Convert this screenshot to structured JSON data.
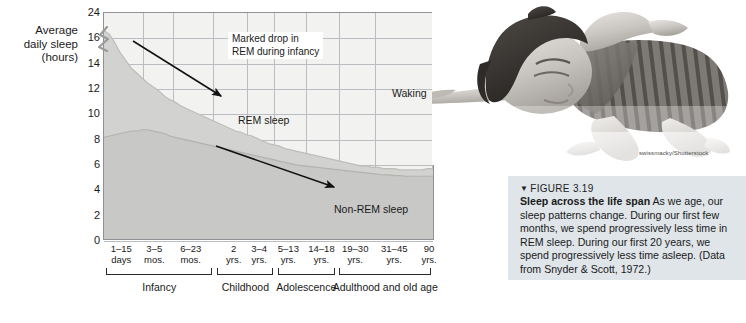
{
  "figure": {
    "number": "FIGURE 3.19",
    "marker_glyph": "▼",
    "title": "Sleep across the life span",
    "body": "As we age, our sleep patterns change. During our first few months, we spend progressively less time in REM sleep. During our first 20 years, we spend progressively less time asleep. (Data from Snyder & Scott, 1972.)",
    "photo_credit": "swissmacky/Shutterstock",
    "photo_alt": "sleeping-child-photo"
  },
  "chart_data": {
    "type": "area",
    "title": "",
    "ylabel": "Average daily sleep (hours)",
    "ylabel_lines": [
      "Average",
      "daily sleep",
      "(hours)"
    ],
    "xlabel": "",
    "ylim": [
      0,
      18
    ],
    "y_ticks": [
      0,
      2,
      4,
      6,
      8,
      10,
      12,
      14,
      16,
      24
    ],
    "y_axis_break": true,
    "y_axis_break_between": [
      16,
      24
    ],
    "grid": true,
    "legend_position": "in-plot-annotations",
    "x_tick_labels": [
      {
        "line1": "1–15",
        "line2": "days",
        "pos": 0.055
      },
      {
        "line1": "3–5",
        "line2": "mos.",
        "pos": 0.155
      },
      {
        "line1": "6–23",
        "line2": "mos.",
        "pos": 0.265
      },
      {
        "line1": "2",
        "line2": "yrs.",
        "pos": 0.395
      },
      {
        "line1": "3–4",
        "line2": "yrs.",
        "pos": 0.472
      },
      {
        "line1": "5–13",
        "line2": "yrs.",
        "pos": 0.56
      },
      {
        "line1": "14–18",
        "line2": "yrs.",
        "pos": 0.66
      },
      {
        "line1": "19–30",
        "line2": "yrs.",
        "pos": 0.762
      },
      {
        "line1": "31–45",
        "line2": "yrs.",
        "pos": 0.88
      },
      {
        "line1": "90",
        "line2": "yrs.",
        "pos": 0.985
      }
    ],
    "series": [
      {
        "name": "Total sleep (REM + Non-REM)",
        "color": "#d2d2d0",
        "values": [
          16.6,
          16.3,
          15.6,
          14.8,
          14.2,
          13.6,
          13.2,
          12.8,
          12.4,
          12.1,
          11.8,
          11.4,
          11.1,
          10.9,
          10.6,
          10.4,
          10.2,
          10.0,
          9.8,
          9.6,
          9.4,
          9.2,
          9.0,
          8.8,
          8.6,
          8.5,
          8.3,
          8.2,
          8.0,
          7.8,
          7.6,
          7.5,
          7.4,
          7.2,
          7.1,
          7.0,
          6.9,
          6.8,
          6.7,
          6.6,
          6.5,
          6.4,
          6.3,
          6.2,
          6.1,
          6.0,
          5.9,
          5.8,
          5.8,
          5.7,
          5.7,
          5.6,
          5.6,
          5.6,
          5.5,
          5.5,
          5.5,
          5.5,
          5.5,
          5.6,
          5.6
        ]
      },
      {
        "name": "Non-REM sleep",
        "color": "#c8c8c6",
        "values": [
          8.1,
          8.2,
          8.3,
          8.4,
          8.5,
          8.6,
          8.6,
          8.7,
          8.7,
          8.6,
          8.5,
          8.4,
          8.2,
          8.1,
          8.0,
          7.9,
          7.8,
          7.7,
          7.6,
          7.5,
          7.4,
          7.3,
          7.2,
          7.1,
          7.0,
          6.9,
          6.8,
          6.7,
          6.6,
          6.5,
          6.4,
          6.3,
          6.2,
          6.1,
          6.0,
          5.9,
          5.85,
          5.8,
          5.75,
          5.7,
          5.65,
          5.6,
          5.55,
          5.5,
          5.45,
          5.4,
          5.35,
          5.3,
          5.25,
          5.2,
          5.15,
          5.1,
          5.1,
          5.05,
          5.05,
          5.0,
          5.0,
          5.0,
          5.0,
          5.0,
          5.0
        ]
      }
    ],
    "annotations": [
      {
        "id": "marked-drop",
        "text_lines": [
          "Marked drop in",
          "REM during infancy"
        ],
        "has_arrow": true
      },
      {
        "id": "rem-sleep",
        "text_lines": [
          "REM sleep"
        ],
        "has_arrow": false
      },
      {
        "id": "waking",
        "text_lines": [
          "Waking"
        ],
        "has_arrow": false
      },
      {
        "id": "non-rem-sleep",
        "text_lines": [
          "Non-REM sleep"
        ],
        "has_arrow": true
      }
    ],
    "life_stages": [
      {
        "label": "Infancy",
        "start": 0.01,
        "end": 0.33
      },
      {
        "label": "Childhood",
        "start": 0.345,
        "end": 0.515
      },
      {
        "label": "Adolescence",
        "start": 0.528,
        "end": 0.7
      },
      {
        "label": "Adulthood and old age",
        "start": 0.713,
        "end": 0.992
      }
    ],
    "colors": {
      "plot_bg": "#f2f2f0",
      "grid": "#b9bcc0",
      "axis": "#8f9194",
      "band_total": "#d2d2d0",
      "band_nonrem": "#c8c8c6",
      "caption_bg": "#dfe5e9",
      "text": "#1a1a1a"
    }
  }
}
